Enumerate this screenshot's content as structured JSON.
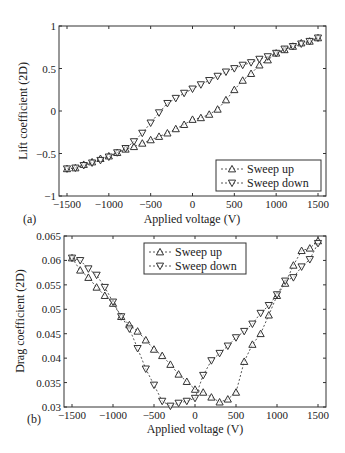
{
  "chart_data": [
    {
      "panel": "(a)",
      "type": "line",
      "title": "",
      "xlabel": "Applied voltage (V)",
      "ylabel": "Lift coefficient (2D)",
      "xlim": [
        -1600,
        1600
      ],
      "ylim": [
        -1,
        1
      ],
      "xticks": [
        -1500,
        -1000,
        -500,
        0,
        500,
        1000,
        1500
      ],
      "xtick_labels": [
        "−1500",
        "−1000",
        "−500",
        "0",
        "500",
        "1000",
        "1500"
      ],
      "yticks": [
        -1,
        -0.5,
        0,
        0.5,
        1
      ],
      "ytick_labels": [
        "−1",
        "−0.5",
        "0",
        "0.5",
        "1"
      ],
      "grid": false,
      "legend_position": "lower right",
      "x": [
        -1500,
        -1400,
        -1300,
        -1200,
        -1100,
        -1000,
        -900,
        -800,
        -700,
        -600,
        -500,
        -400,
        -300,
        -200,
        -100,
        0,
        100,
        200,
        300,
        400,
        500,
        600,
        700,
        800,
        900,
        1000,
        1100,
        1200,
        1300,
        1400,
        1500
      ],
      "series": [
        {
          "name": "Sweep up",
          "marker": "triangle-up",
          "values": [
            -0.68,
            -0.67,
            -0.63,
            -0.6,
            -0.56,
            -0.53,
            -0.49,
            -0.45,
            -0.42,
            -0.38,
            -0.34,
            -0.3,
            -0.26,
            -0.21,
            -0.16,
            -0.1,
            -0.08,
            -0.04,
            0.02,
            0.13,
            0.25,
            0.36,
            0.44,
            0.54,
            0.6,
            0.68,
            0.72,
            0.76,
            0.8,
            0.82,
            0.86
          ]
        },
        {
          "name": "Sweep down",
          "marker": "triangle-down",
          "values": [
            -0.68,
            -0.67,
            -0.64,
            -0.61,
            -0.58,
            -0.54,
            -0.49,
            -0.44,
            -0.36,
            -0.26,
            -0.14,
            -0.02,
            0.09,
            0.15,
            0.21,
            0.26,
            0.31,
            0.36,
            0.41,
            0.46,
            0.5,
            0.54,
            0.57,
            0.61,
            0.64,
            0.68,
            0.73,
            0.76,
            0.79,
            0.82,
            0.86
          ]
        }
      ]
    },
    {
      "panel": "(b)",
      "type": "line",
      "title": "",
      "xlabel": "Applied voltage (V)",
      "ylabel": "Drag coefficient (2D)",
      "xlim": [
        -1600,
        1600
      ],
      "ylim": [
        0.03,
        0.065
      ],
      "xticks": [
        -1500,
        -1000,
        -500,
        0,
        500,
        1000,
        1500
      ],
      "xtick_labels": [
        "−1500",
        "−1000",
        "−500",
        "0",
        "500",
        "1000",
        "1500"
      ],
      "yticks": [
        0.03,
        0.035,
        0.04,
        0.045,
        0.05,
        0.055,
        0.06,
        0.065
      ],
      "ytick_labels": [
        "0.03",
        "0.035",
        "0.04",
        "0.045",
        "0.05",
        "0.055",
        "0.06",
        "0.065"
      ],
      "grid": false,
      "legend_position": "upper center",
      "x": [
        -1500,
        -1400,
        -1300,
        -1200,
        -1100,
        -1000,
        -900,
        -800,
        -700,
        -600,
        -500,
        -400,
        -300,
        -200,
        -100,
        0,
        100,
        200,
        300,
        400,
        500,
        600,
        700,
        800,
        900,
        1000,
        1100,
        1200,
        1300,
        1400,
        1500
      ],
      "series": [
        {
          "name": "Sweep up",
          "marker": "triangle-up",
          "values": [
            0.0605,
            0.058,
            0.0565,
            0.0545,
            0.0528,
            0.0512,
            0.0485,
            0.0468,
            0.0455,
            0.0437,
            0.0418,
            0.0405,
            0.0387,
            0.0367,
            0.0352,
            0.0336,
            0.033,
            0.032,
            0.031,
            0.0316,
            0.033,
            0.0393,
            0.0428,
            0.045,
            0.0488,
            0.0528,
            0.0553,
            0.059,
            0.062,
            0.0625,
            0.064
          ]
        },
        {
          "name": "Sweep down",
          "marker": "triangle-down",
          "values": [
            0.0605,
            0.06,
            0.0583,
            0.057,
            0.0545,
            0.0515,
            0.0485,
            0.046,
            0.042,
            0.0378,
            0.0345,
            0.0312,
            0.0302,
            0.0308,
            0.0312,
            0.0318,
            0.0365,
            0.0395,
            0.041,
            0.0425,
            0.0442,
            0.0455,
            0.047,
            0.0492,
            0.0508,
            0.053,
            0.0558,
            0.0565,
            0.0587,
            0.0602,
            0.0635
          ]
        }
      ]
    }
  ],
  "panels": {
    "a": {
      "label": "(a)",
      "xlabel": "Applied voltage (V)",
      "ylabel": "Lift coefficient (2D)",
      "legend": [
        "Sweep up",
        "Sweep down"
      ]
    },
    "b": {
      "label": "(b)",
      "xlabel": "Applied voltage (V)",
      "ylabel": "Drag coefficient (2D)",
      "legend": [
        "Sweep up",
        "Sweep down"
      ]
    }
  },
  "layout": {
    "a": {
      "frame": [
        59,
        26,
        326,
        196
      ],
      "xmap": [
        -1500,
        67,
        1500,
        318
      ],
      "ymap": [
        -1,
        196,
        1,
        26
      ],
      "legend_box": [
        216,
        160,
        321,
        191
      ]
    },
    "b": {
      "frame": [
        64,
        236,
        326,
        407
      ],
      "xmap": [
        -1500,
        72,
        1500,
        318
      ],
      "ymap": [
        0.03,
        407,
        0.065,
        236
      ],
      "legend_box": [
        144,
        243,
        246,
        274
      ]
    }
  }
}
